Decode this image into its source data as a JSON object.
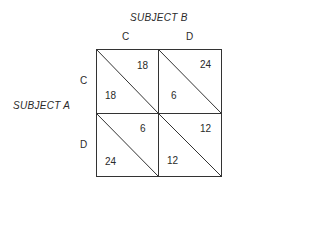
{
  "diagram": {
    "type": "payoff-matrix",
    "column_player": "SUBJECT B",
    "row_player": "SUBJECT A",
    "column_strategies": [
      "C",
      "D"
    ],
    "row_strategies": [
      "C",
      "D"
    ],
    "cells": [
      {
        "row": "C",
        "col": "C",
        "payoff_b": "18",
        "payoff_a": "18"
      },
      {
        "row": "C",
        "col": "D",
        "payoff_b": "24",
        "payoff_a": "6"
      },
      {
        "row": "D",
        "col": "C",
        "payoff_b": "6",
        "payoff_a": "24"
      },
      {
        "row": "D",
        "col": "D",
        "payoff_b": "12",
        "payoff_a": "12"
      }
    ],
    "line_color": "#333333"
  }
}
